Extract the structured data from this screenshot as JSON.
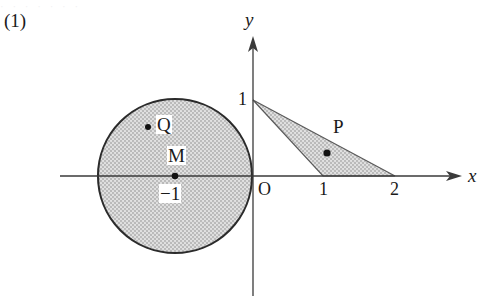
{
  "figure": {
    "problem_number": "(1)",
    "cut_off_header": "· · ·   · · · ·",
    "axes": {
      "x_label": "x",
      "y_label": "y",
      "origin_label": "O"
    },
    "ticks": {
      "y_one": "1",
      "x_one": "1",
      "x_two": "2"
    },
    "circle": {
      "center_label": "M",
      "center_value_label": "−1",
      "point_label": "Q",
      "center_x": -1,
      "center_y": 0,
      "radius": 1,
      "fill": "#cfcfcf",
      "stroke": "#2b2b2b"
    },
    "triangle": {
      "point_label": "P",
      "vertices": [
        [
          0,
          1
        ],
        [
          1,
          0
        ],
        [
          2,
          0
        ]
      ],
      "fill": "#cfcfcf",
      "stroke": "#555555"
    },
    "points": {
      "M": [
        -1,
        0
      ],
      "Q": [
        -1.38,
        0.64
      ],
      "P": [
        1.04,
        0.33
      ]
    },
    "colors": {
      "axis": "#3a3a3a",
      "shade": "#cfcfcf",
      "ink": "#1a1a1a"
    }
  }
}
